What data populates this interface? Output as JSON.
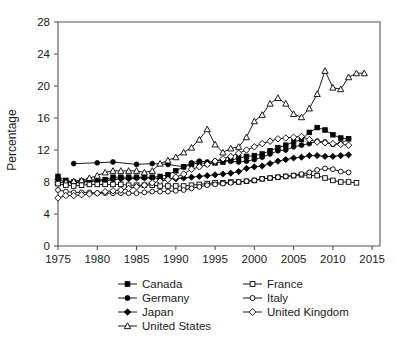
{
  "chart_data": {
    "type": "line",
    "title": "",
    "xlabel": "",
    "ylabel": "Percentage",
    "xlim": [
      1975,
      2016
    ],
    "ylim": [
      0,
      28
    ],
    "xticks": [
      1975,
      1980,
      1985,
      1990,
      1995,
      2000,
      2005,
      2010,
      2015
    ],
    "yticks": [
      0,
      4,
      8,
      12,
      16,
      20,
      24,
      28
    ],
    "grid": false,
    "legend_position": "below",
    "series": [
      {
        "name": "Canada",
        "marker": "filled-square",
        "x": [
          1975,
          1976,
          1977,
          1978,
          1979,
          1980,
          1981,
          1982,
          1983,
          1984,
          1985,
          1986,
          1987,
          1988,
          1989,
          1990,
          1991,
          1992,
          1993,
          1994,
          1995,
          1996,
          1997,
          1998,
          1999,
          2000,
          2001,
          2002,
          2003,
          2004,
          2005,
          2006,
          2007,
          2008,
          2009,
          2010,
          2011,
          2012
        ],
        "values": [
          8.7,
          8.2,
          8.0,
          8.1,
          8.2,
          8.3,
          8.3,
          8.6,
          8.6,
          8.6,
          8.6,
          8.6,
          8.6,
          8.7,
          8.9,
          9.4,
          9.9,
          10.2,
          10.4,
          10.3,
          10.4,
          10.5,
          10.7,
          11.0,
          11.2,
          11.3,
          11.5,
          11.9,
          12.3,
          12.6,
          13.0,
          13.3,
          14.2,
          14.8,
          14.5,
          13.9,
          13.5,
          13.4
        ]
      },
      {
        "name": "Germany",
        "marker": "filled-circle",
        "x": [
          1977,
          1980,
          1982,
          1985,
          1987,
          1989,
          1991,
          1992,
          1993,
          1994,
          1995,
          1996,
          1997,
          1998,
          1999,
          2000,
          2001,
          2002,
          2003,
          2004,
          2005,
          2006,
          2007,
          2008,
          2009,
          2010,
          2011,
          2012
        ],
        "values": [
          10.3,
          10.4,
          10.5,
          10.2,
          10.3,
          10.2,
          9.9,
          10.4,
          10.6,
          10.5,
          10.6,
          10.8,
          10.6,
          10.5,
          10.6,
          10.8,
          11.1,
          11.5,
          11.9,
          12.0,
          12.4,
          12.6,
          12.8,
          13.1,
          13.0,
          12.7,
          12.8,
          13.4
        ]
      },
      {
        "name": "Japan",
        "marker": "filled-diamond",
        "x": [
          1975,
          1976,
          1977,
          1978,
          1979,
          1980,
          1981,
          1982,
          1983,
          1984,
          1985,
          1986,
          1987,
          1988,
          1989,
          1990,
          1991,
          1992,
          1993,
          1994,
          1995,
          1996,
          1997,
          1998,
          1999,
          2000,
          2001,
          2002,
          2003,
          2004,
          2005,
          2006,
          2007,
          2008,
          2009,
          2010,
          2011,
          2012
        ],
        "values": [
          8.3,
          8.0,
          7.9,
          8.0,
          8.1,
          8.1,
          8.2,
          8.3,
          8.4,
          8.4,
          8.5,
          8.5,
          8.5,
          8.4,
          8.4,
          8.4,
          8.5,
          8.6,
          8.7,
          8.8,
          8.9,
          9.0,
          9.1,
          9.3,
          9.7,
          9.9,
          10.0,
          10.3,
          10.6,
          10.8,
          11.0,
          11.1,
          11.3,
          11.3,
          11.2,
          11.2,
          11.3,
          11.4
        ]
      },
      {
        "name": "United States",
        "marker": "open-triangle",
        "x": [
          1975,
          1976,
          1977,
          1978,
          1979,
          1980,
          1981,
          1982,
          1983,
          1984,
          1985,
          1986,
          1987,
          1988,
          1989,
          1990,
          1991,
          1992,
          1993,
          1994,
          1995,
          1996,
          1997,
          1998,
          1999,
          2000,
          2001,
          2002,
          2003,
          2004,
          2005,
          2006,
          2007,
          2008,
          2009,
          2010,
          2011,
          2012,
          2013,
          2014
        ],
        "values": [
          7.9,
          8.0,
          8.1,
          8.2,
          8.5,
          8.8,
          9.2,
          9.4,
          9.4,
          9.4,
          9.4,
          9.2,
          9.4,
          10.3,
          10.7,
          11.1,
          11.7,
          12.3,
          13.3,
          14.6,
          12.7,
          11.7,
          12.2,
          12.4,
          13.6,
          15.6,
          16.4,
          17.8,
          18.5,
          17.8,
          16.5,
          16.1,
          17.2,
          19.0,
          21.9,
          19.8,
          19.6,
          21.1,
          21.6,
          21.6
        ]
      },
      {
        "name": "France",
        "marker": "open-square",
        "x": [
          1975,
          1976,
          1977,
          1978,
          1979,
          1980,
          1981,
          1982,
          1983,
          1984,
          1985,
          1986,
          1987,
          1988,
          1989,
          1990,
          1991,
          1992,
          1993,
          1994,
          1995,
          1996,
          1997,
          1998,
          1999,
          2000,
          2001,
          2002,
          2003,
          2004,
          2005,
          2006,
          2007,
          2008,
          2009,
          2010,
          2011,
          2012,
          2013
        ],
        "values": [
          7.8,
          7.6,
          7.5,
          7.6,
          7.7,
          7.7,
          7.7,
          7.7,
          7.7,
          7.6,
          7.6,
          7.6,
          7.6,
          7.5,
          7.5,
          7.5,
          7.5,
          7.6,
          7.7,
          7.8,
          7.9,
          7.9,
          8.0,
          8.0,
          8.1,
          8.2,
          8.4,
          8.5,
          8.6,
          8.7,
          8.8,
          8.9,
          8.8,
          8.8,
          8.5,
          8.2,
          8.0,
          8.0,
          7.9
        ]
      },
      {
        "name": "Italy",
        "marker": "open-circle",
        "x": [
          1975,
          1976,
          1977,
          1978,
          1979,
          1980,
          1981,
          1982,
          1983,
          1984,
          1985,
          1986,
          1987,
          1988,
          1989,
          1990,
          1991,
          1992,
          1993,
          1994,
          1995,
          1996,
          1997,
          1998,
          1999,
          2000,
          2001,
          2002,
          2003,
          2004,
          2005,
          2006,
          2007,
          2008,
          2009,
          2010,
          2011,
          2012
        ],
        "values": [
          7.0,
          6.8,
          6.7,
          6.7,
          6.7,
          6.6,
          6.6,
          6.6,
          6.6,
          6.6,
          6.6,
          6.7,
          6.8,
          6.8,
          6.8,
          6.9,
          7.0,
          7.2,
          7.4,
          7.6,
          7.7,
          7.8,
          7.9,
          8.0,
          8.1,
          8.2,
          8.4,
          8.5,
          8.6,
          8.7,
          8.8,
          9.0,
          9.2,
          9.5,
          9.7,
          9.6,
          9.3,
          9.2
        ]
      },
      {
        "name": "United Kingdom",
        "marker": "open-diamond",
        "x": [
          1975,
          1976,
          1977,
          1978,
          1979,
          1980,
          1981,
          1982,
          1983,
          1984,
          1985,
          1986,
          1987,
          1988,
          1989,
          1990,
          1991,
          1992,
          1993,
          1994,
          1995,
          1996,
          1997,
          1998,
          1999,
          2000,
          2001,
          2002,
          2003,
          2004,
          2005,
          2006,
          2007,
          2008,
          2009,
          2010,
          2011,
          2012
        ],
        "values": [
          6.0,
          6.3,
          6.3,
          6.4,
          6.5,
          6.6,
          6.8,
          6.9,
          7.0,
          7.2,
          7.4,
          7.6,
          7.9,
          8.1,
          8.3,
          8.6,
          9.0,
          9.6,
          9.9,
          10.2,
          10.6,
          10.9,
          11.2,
          11.6,
          12.0,
          12.4,
          12.8,
          13.1,
          13.4,
          13.5,
          13.6,
          13.7,
          13.3,
          13.0,
          12.9,
          12.8,
          12.7,
          12.6
        ]
      }
    ]
  },
  "legend": {
    "entries": [
      {
        "label": "Canada",
        "marker": "filled-square"
      },
      {
        "label": "Germany",
        "marker": "filled-circle"
      },
      {
        "label": "Japan",
        "marker": "filled-diamond"
      },
      {
        "label": "United States",
        "marker": "open-triangle"
      },
      {
        "label": "France",
        "marker": "open-square"
      },
      {
        "label": "Italy",
        "marker": "open-circle"
      },
      {
        "label": "United Kingdom",
        "marker": "open-diamond"
      }
    ]
  },
  "colors": {
    "ink": "#000000",
    "frame": "#555555",
    "background": "#ffffff"
  }
}
